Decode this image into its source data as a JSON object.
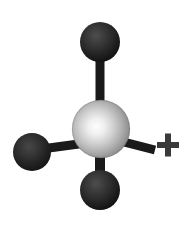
{
  "figure": {
    "type": "ball-and-stick-molecular-model",
    "title": "Methyl cation ball-and-stick model",
    "background_color": "#ffffff",
    "width": 188,
    "height": 226
  },
  "palette": {
    "background": "#ffffff",
    "central_atom_light": "#f2f2f2",
    "central_atom_mid": "#b9b9b9",
    "central_atom_dark": "#8a8a8a",
    "central_atom_edge": "#6e6e6e",
    "substituent_atom_light": "#4a4a4a",
    "substituent_atom_dark": "#151515",
    "substituent_atom_edge": "#0d0d0d",
    "bond_color": "#1a1a1a",
    "charge_color": "#3a3a3a"
  },
  "atoms": [
    {
      "id": "central-atom",
      "label": "central atom",
      "role": "center",
      "shade": "light-gray",
      "cx": 101,
      "cy": 129,
      "r": 29
    },
    {
      "id": "atom-top",
      "label": "top substituent atom",
      "role": "substituent",
      "shade": "dark",
      "cx": 100,
      "cy": 42,
      "r": 20
    },
    {
      "id": "atom-left",
      "label": "left substituent atom",
      "role": "substituent",
      "shade": "dark",
      "cx": 32,
      "cy": 152,
      "r": 19
    },
    {
      "id": "atom-bottom",
      "label": "bottom substituent atom",
      "role": "substituent",
      "shade": "dark",
      "cx": 100,
      "cy": 190,
      "r": 20
    }
  ],
  "bonds": [
    {
      "id": "bond-top",
      "label": "bond to top atom",
      "from": "central-atom",
      "to": "atom-top",
      "x1": 100,
      "y1": 128,
      "x2": 100,
      "y2": 42,
      "width": 9
    },
    {
      "id": "bond-left",
      "label": "bond to left atom",
      "from": "central-atom",
      "to": "atom-left",
      "x1": 101,
      "y1": 141,
      "x2": 34,
      "y2": 150,
      "width": 9
    },
    {
      "id": "bond-bottom",
      "label": "bond to bottom atom",
      "from": "central-atom",
      "to": "atom-bottom",
      "x1": 100,
      "y1": 130,
      "x2": 100,
      "y2": 191,
      "width": 10
    },
    {
      "id": "bond-right-stub",
      "label": "bond stub to right",
      "from": "central-atom",
      "to": "charge-symbol",
      "x1": 116,
      "y1": 140,
      "x2": 155,
      "y2": 150,
      "width": 9
    }
  ],
  "charge": {
    "id": "charge-symbol",
    "symbol": "+",
    "meaning": "positive charge",
    "cx": 168,
    "cy": 145,
    "arm_length": 11,
    "thickness": 6
  },
  "alt_text": "Ball-and-stick molecular model: a large light gray central sphere bonded to three dark spheres at top, left and bottom, with a plus sign at the right indicating a positive charge."
}
